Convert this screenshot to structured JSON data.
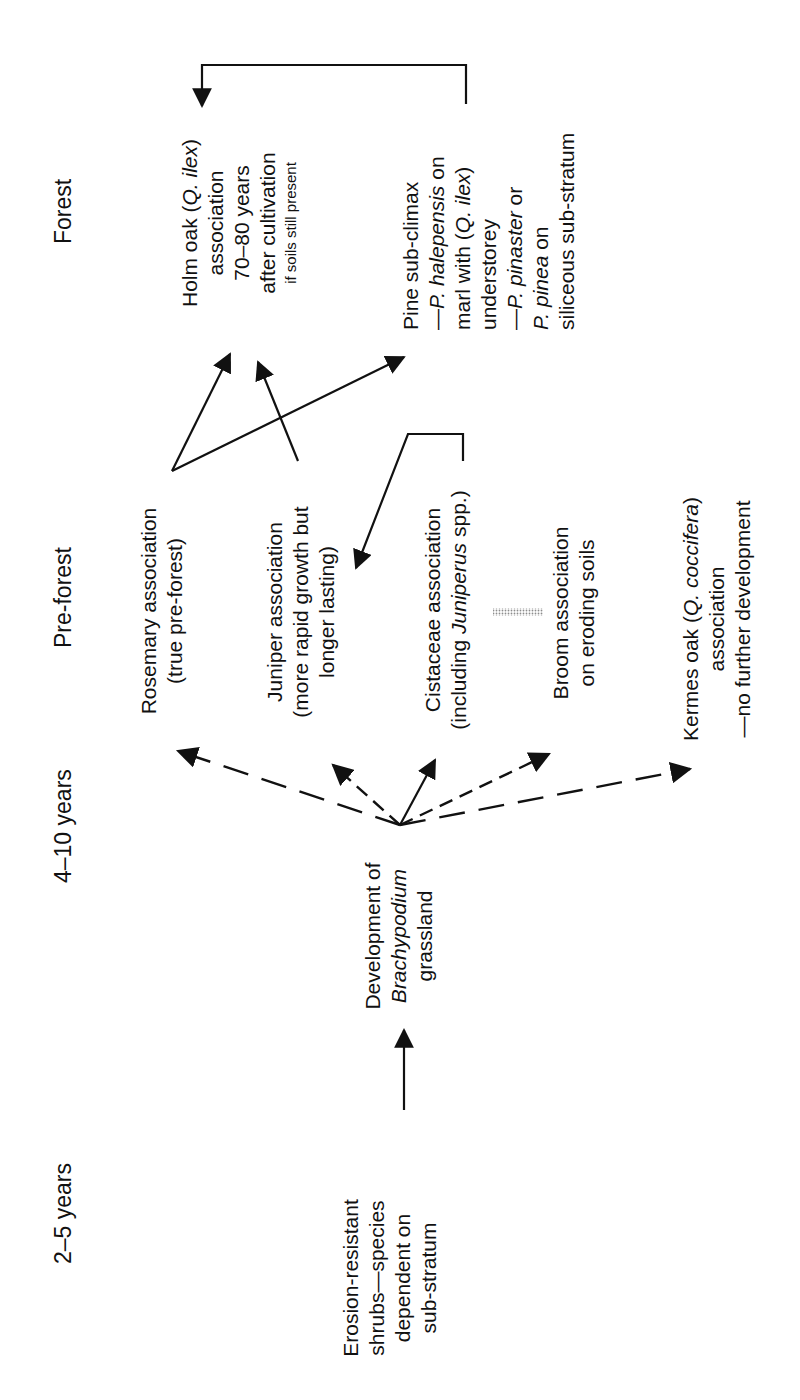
{
  "diagram": {
    "type": "succession-flowchart",
    "orientation": "rotated-90-ccw",
    "stages": [
      {
        "id": "stage-1",
        "label": "2–5 years"
      },
      {
        "id": "stage-2",
        "label": "4–10 years"
      },
      {
        "id": "stage-3",
        "label": "Pre-forest"
      },
      {
        "id": "stage-4",
        "label": "Forest"
      }
    ],
    "nodes": {
      "erosion": {
        "lines": [
          "Erosion-resistant",
          "shrubs—species",
          "dependent on",
          "sub-stratum"
        ]
      },
      "brachypodium": {
        "line1": "Development of",
        "line2": "Brachypodium",
        "line3": "grassland"
      },
      "rosemary": {
        "line1": "Rosemary association",
        "line2": "(true pre-forest)"
      },
      "juniper": {
        "line1": "Juniper association",
        "line2": "(more rapid growth but",
        "line3": "longer lasting)"
      },
      "cistaceae": {
        "line1": "Cistaceae association",
        "line2_pre": "(including ",
        "line2_italic": "Juniperus",
        "line2_post": " spp.)"
      },
      "broom": {
        "line1": "Broom association",
        "line2": "on eroding soils"
      },
      "kermes": {
        "line1_pre": "Kermes oak (",
        "line1_italic": "Q. coccifera",
        "line1_post": ")",
        "line2": "association",
        "line3": "—no further development"
      },
      "holm": {
        "line1_pre": "Holm oak (",
        "line1_italic": "Q. ilex",
        "line1_post": ")",
        "line2": "association",
        "line3": "70–80 years",
        "line4": "after cultivation",
        "line5": "if soils still present"
      },
      "pine": {
        "line1": "Pine sub-climax",
        "line2_pre": "—",
        "line2_italic": "P. halepensis",
        "line2_post": " on",
        "line3_pre": "marl with (",
        "line3_italic": "Q. ilex",
        "line3_post": ")",
        "line4": "understorey",
        "line5_pre": "—",
        "line5_italic": "P. pinaster",
        "line5_post": " or",
        "line6_italic": "P. pinea",
        "line6_post": " on",
        "line7": "siliceous sub-stratum"
      }
    },
    "edges": [
      {
        "from": "erosion",
        "to": "brachypodium",
        "style": "solid"
      },
      {
        "from": "brachypodium",
        "to": "rosemary",
        "style": "dashed"
      },
      {
        "from": "brachypodium",
        "to": "juniper",
        "style": "dashed"
      },
      {
        "from": "brachypodium",
        "to": "cistaceae",
        "style": "solid"
      },
      {
        "from": "brachypodium",
        "to": "broom",
        "style": "dashed"
      },
      {
        "from": "brachypodium",
        "to": "kermes",
        "style": "dashed"
      },
      {
        "from": "rosemary",
        "to": "holm",
        "style": "solid"
      },
      {
        "from": "rosemary",
        "to": "pine",
        "style": "solid"
      },
      {
        "from": "juniper",
        "to": "holm",
        "style": "solid"
      },
      {
        "from": "cistaceae",
        "to": "juniper",
        "style": "solid-bracket"
      },
      {
        "from": "pine",
        "to": "holm",
        "style": "solid-bracket"
      },
      {
        "from": "broom",
        "to": "cistaceae",
        "style": "stippled-gray"
      }
    ],
    "colors": {
      "ink": "#111111",
      "stipple": "#9a9a9a",
      "background": "#ffffff"
    }
  }
}
